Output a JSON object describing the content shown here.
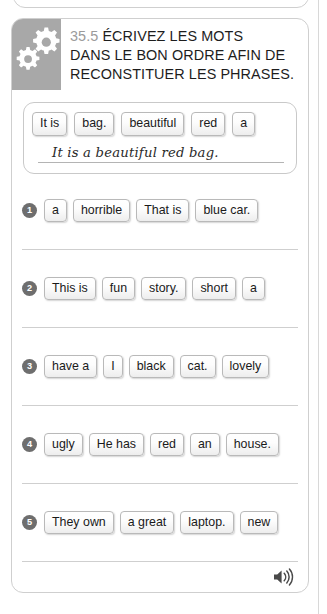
{
  "header": {
    "exercise_number": "35.5",
    "instruction_line1": "ÉCRIVEZ LES MOTS",
    "instruction_line2": "DANS LE BON ORDRE AFIN DE",
    "instruction_line3": "RECONSTITUER LES PHRASES.",
    "icon": "gears-icon",
    "icon_bg_color": "#a8a8a8"
  },
  "example": {
    "chips": [
      "It is",
      "bag.",
      "beautiful",
      "red",
      "a"
    ],
    "answer": "It is a beautiful red bag."
  },
  "questions": [
    {
      "number": "1",
      "chips": [
        "a",
        "horrible",
        "That is",
        "blue car."
      ]
    },
    {
      "number": "2",
      "chips": [
        "This is",
        "fun",
        "story.",
        "short",
        "a"
      ]
    },
    {
      "number": "3",
      "chips": [
        "have a",
        "I",
        "black",
        "cat.",
        "lovely"
      ]
    },
    {
      "number": "4",
      "chips": [
        "ugly",
        "He has",
        "red",
        "an",
        "house."
      ]
    },
    {
      "number": "5",
      "chips": [
        "They own",
        "a great",
        "laptop.",
        "new"
      ]
    }
  ],
  "footer": {
    "audio_icon": "speaker-icon"
  },
  "colors": {
    "card_border": "#cfcfcf",
    "badge_bg": "#6e6e6e",
    "number_gray": "#9b9b9b",
    "text": "#1d1d1d"
  }
}
